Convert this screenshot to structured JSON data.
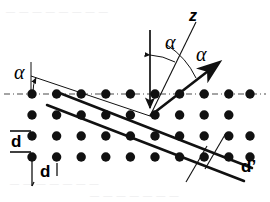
{
  "figure": {
    "type": "crystal-lattice-bragg-diffraction-diagram",
    "width": 270,
    "height": 202,
    "background": "#ffffff",
    "ink": "#000000"
  },
  "labels": {
    "alpha_surface": "α",
    "alpha_incident": "α",
    "alpha_scattered": "α",
    "axis_z": "z",
    "spacing_vertical": "d",
    "spacing_horizontal": "d",
    "spacing_planes": "d’"
  },
  "lattice": {
    "dot_color": "#111111",
    "dot_radius": 4.6,
    "columns": 10,
    "rows": 4,
    "origin_x": 32,
    "origin_y": 94,
    "step_x": 24.6,
    "step_y": 21,
    "row_offsets": [
      0,
      0,
      0,
      0
    ],
    "row_counts": [
      10,
      9,
      10,
      10
    ]
  },
  "surface_line": {
    "style": "dash-dot",
    "color": "#3a3a3a",
    "y": 94,
    "x_start": 4,
    "x_end": 266
  },
  "planes": {
    "color": "#111111",
    "stroke_width": 2.4,
    "count": 2,
    "angle_label": "d’"
  },
  "beams": {
    "normal": {
      "name": "z",
      "direction": "down",
      "style": "thin-solid-arrow"
    },
    "incident": {
      "style": "thin-line"
    },
    "scattered": {
      "style": "thick-arrow"
    }
  },
  "bg_text": {
    "l1": "— — —   — —   — — —",
    "l2": "— —   — — — —   —",
    "l3": "— — —   — —   — —"
  }
}
